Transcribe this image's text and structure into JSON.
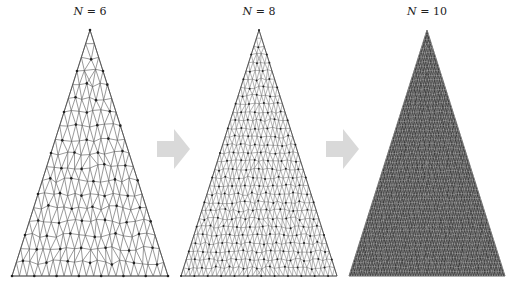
{
  "panels": [
    {
      "label_var": "N",
      "label_eq": " = 6",
      "center_x": 90,
      "density": 6,
      "fill": "#ffffff"
    },
    {
      "label_var": "N",
      "label_eq": " = 8",
      "center_x": 259,
      "density": 10,
      "fill": "#ffffff"
    },
    {
      "label_var": "N",
      "label_eq": " = 10",
      "center_x": 427,
      "density": 18,
      "fill": "#3a3a3a"
    }
  ],
  "arrows": [
    {
      "name": "refine-arrow-1",
      "x": 157
    },
    {
      "name": "refine-arrow-2",
      "x": 326
    }
  ],
  "colors": {
    "mesh_line": "#555555",
    "arrow": "#d9d9d9",
    "dark_fill": "#3a3a3a"
  }
}
